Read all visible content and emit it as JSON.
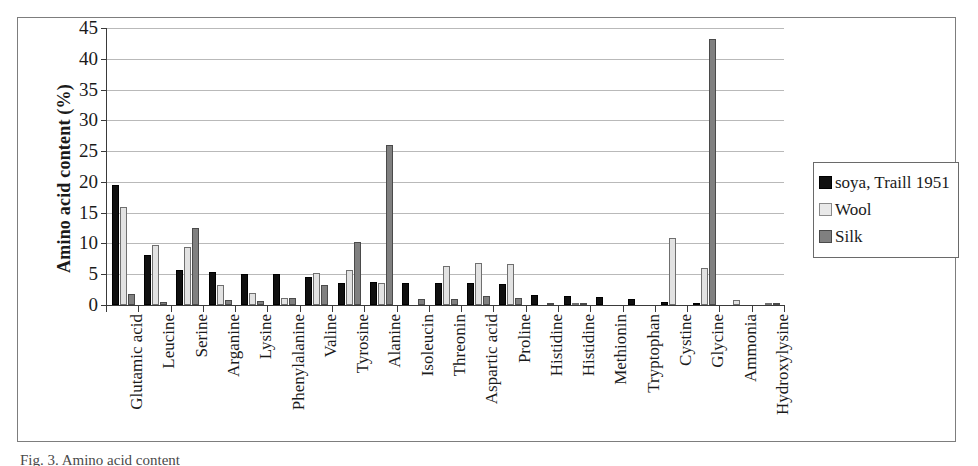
{
  "figure": {
    "caption": "Fig. 3. Amino acid content"
  },
  "legend": {
    "position": "right",
    "entries": [
      {
        "label": "soya, Traill 1951",
        "swatch": "black-square-icon",
        "color": "#101010"
      },
      {
        "label": "Wool",
        "swatch": "light-gray-square-icon",
        "color": "#e9e9e9"
      },
      {
        "label": "Silk",
        "swatch": "mid-gray-square-icon",
        "color": "#808080"
      }
    ]
  },
  "chart_data": {
    "type": "bar",
    "title": "",
    "xlabel": "",
    "ylabel": "Amino acid content (%)",
    "ylim": [
      0,
      45
    ],
    "yticks": [
      0,
      5,
      10,
      15,
      20,
      25,
      30,
      35,
      40,
      45
    ],
    "ytick_labels": [
      "0",
      "5",
      "10",
      "15",
      "20",
      "25",
      "30",
      "35",
      "40",
      "45"
    ],
    "grid": true,
    "grid_axis": "y",
    "legend_position": "right",
    "categories": [
      "Glutamic acid",
      "Leucine",
      "Serine",
      "Arganine",
      "Lysine",
      "Phenylalanine",
      "Valine",
      "Tyrosine",
      "Alanine",
      "Isoleucin",
      "Threonin",
      "Aspartic acid",
      "Proline",
      "Histidine",
      "Histidine",
      "Methionin",
      "Tryptophan",
      "Cystine",
      "Glycine",
      "Ammonia",
      "Hydroxylysine"
    ],
    "series": [
      {
        "name": "soya, Traill 1951",
        "color": "#101010",
        "values": [
          19.5,
          8.2,
          5.7,
          5.4,
          5.1,
          5.0,
          4.6,
          3.6,
          3.8,
          3.6,
          3.5,
          3.5,
          3.4,
          1.7,
          1.5,
          1.3,
          0.9,
          0.5,
          0.4,
          0.0,
          0.0
        ]
      },
      {
        "name": "Wool",
        "color": "#e9e9e9",
        "values": [
          16.0,
          9.7,
          9.4,
          3.3,
          2.0,
          1.2,
          5.2,
          5.7,
          3.6,
          0.0,
          6.4,
          6.8,
          6.7,
          0.0,
          0.3,
          0.0,
          0.0,
          10.9,
          6.0,
          0.8,
          0.2
        ]
      },
      {
        "name": "Silk",
        "color": "#808080",
        "values": [
          1.8,
          0.5,
          12.5,
          0.8,
          0.6,
          1.1,
          3.2,
          10.3,
          26.0,
          1.0,
          0.9,
          1.5,
          1.2,
          0.2,
          0.2,
          0.0,
          0.0,
          0.0,
          43.2,
          0.0,
          0.2
        ]
      }
    ]
  }
}
